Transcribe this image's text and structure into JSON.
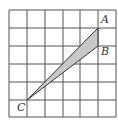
{
  "diagram": {
    "type": "grid-geometry",
    "grid": {
      "columns": 6,
      "rows": 6,
      "line_color": "#555555"
    },
    "points": [
      {
        "name": "A",
        "label": "A",
        "grid_x": 5,
        "grid_y": 1
      },
      {
        "name": "B",
        "label": "B",
        "grid_x": 5,
        "grid_y": 2
      },
      {
        "name": "C",
        "label": "C",
        "grid_x": 1,
        "grid_y": 5
      }
    ],
    "shaded_triangle": {
      "vertices": [
        "A",
        "B",
        "C"
      ],
      "fill": "#c8c8c8"
    }
  }
}
